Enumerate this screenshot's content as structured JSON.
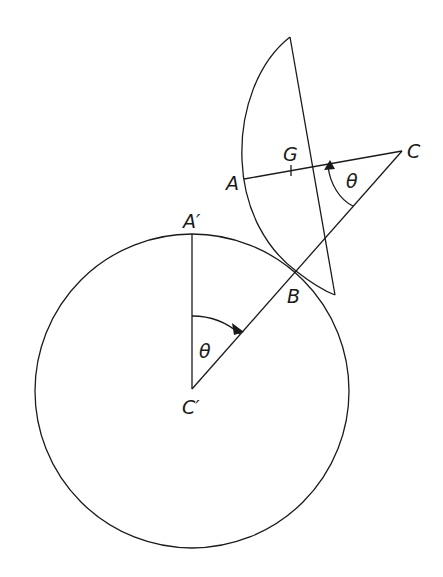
{
  "figure": {
    "labels": {
      "A": "A",
      "G": "G",
      "C": "C",
      "A_prime": "A′",
      "B": "B",
      "C_prime": "C′",
      "theta_top": "θ",
      "theta_bottom": "θ"
    },
    "stroke_color": "#1a1a1a",
    "background": "#ffffff"
  }
}
